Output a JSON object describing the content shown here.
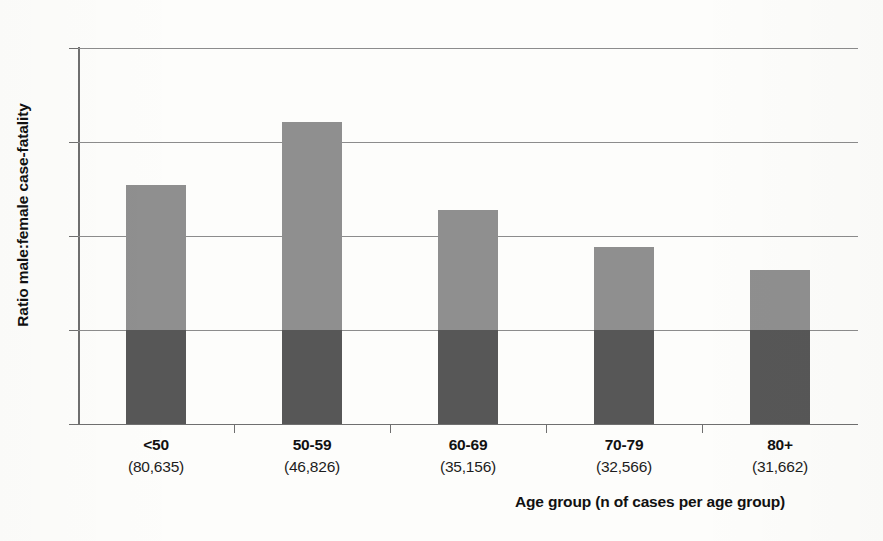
{
  "chart_data": {
    "type": "bar",
    "title": "",
    "subtitle": "",
    "xlabel": "Age group (n of cases per age group)",
    "ylabel": "Ratio male:female case-fatality",
    "categories": [
      "<50",
      "50-59",
      "60-69",
      "70-79",
      "80+"
    ],
    "category_sublabels": [
      "(80,635)",
      "(46,826)",
      "(35,156)",
      "(32,566)",
      "(31,662)"
    ],
    "values": [
      2.54,
      3.21,
      2.28,
      1.88,
      1.64
    ],
    "series": [
      {
        "name": "segment-below-parity",
        "values": [
          1.0,
          1.0,
          1.0,
          1.0,
          1.0
        ],
        "color": "#575757"
      },
      {
        "name": "segment-above-parity",
        "values": [
          1.54,
          2.21,
          1.28,
          0.88,
          0.64
        ],
        "color": "#8f8f8f"
      }
    ],
    "ylim": [
      0,
      4
    ],
    "yticks": [
      0,
      1,
      2,
      3,
      4
    ],
    "ytick_labels": [
      "0",
      "1",
      "2",
      "3",
      "4"
    ],
    "grid": true,
    "grid_axis": "y",
    "legend": "none",
    "stacked": true,
    "parity_line": 1.0
  },
  "axis": {
    "y_title": "Ratio male:female case-fatality",
    "x_title": "Age group (n of cases per age group)"
  },
  "colors": {
    "bar_light": "#8f8f8f",
    "bar_dark": "#575757",
    "grid": "#8c8c8c",
    "axis": "#6f6f6f",
    "background": "#fdfdfb",
    "text": "#111111"
  }
}
